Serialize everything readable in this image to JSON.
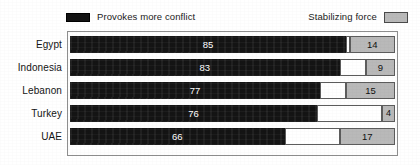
{
  "legend": {
    "left": {
      "label": "Provokes more conflict",
      "swatch": "dark-swatch-icon",
      "color": "#141414"
    },
    "right": {
      "label": "Stabilizing force",
      "swatch": "gray-swatch-icon",
      "color": "#b9b9b9"
    }
  },
  "chart_data": {
    "type": "bar",
    "orientation": "horizontal",
    "stacked": true,
    "title": "",
    "subtitle": "",
    "xlabel": "",
    "ylabel": "",
    "xlim": [
      0,
      100
    ],
    "grid": false,
    "legend_position": "top",
    "categories": [
      "Egypt",
      "Indonesia",
      "Lebanon",
      "Turkey",
      "UAE"
    ],
    "series": [
      {
        "name": "Provokes more conflict",
        "color": "#141414",
        "values": [
          85,
          83,
          77,
          76,
          66
        ]
      },
      {
        "name": "Stabilizing force",
        "color": "#b9b9b9",
        "values": [
          14,
          9,
          15,
          4,
          17
        ]
      }
    ],
    "rows": [
      {
        "category": "Egypt",
        "conflict": 85,
        "stabilizing": 14,
        "gap": 1
      },
      {
        "category": "Indonesia",
        "conflict": 83,
        "stabilizing": 9,
        "gap": 8
      },
      {
        "category": "Lebanon",
        "conflict": 77,
        "stabilizing": 15,
        "gap": 8
      },
      {
        "category": "Turkey",
        "conflict": 76,
        "stabilizing": 4,
        "gap": 20
      },
      {
        "category": "UAE",
        "conflict": 66,
        "stabilizing": 17,
        "gap": 17
      }
    ]
  }
}
